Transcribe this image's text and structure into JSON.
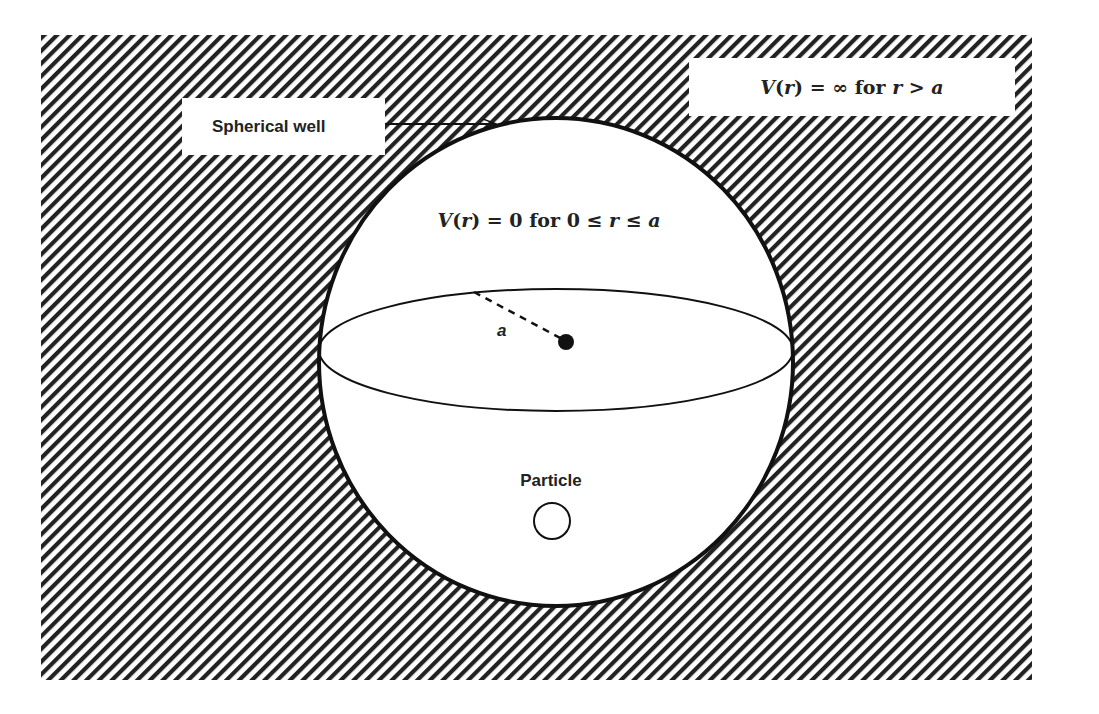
{
  "diagram": {
    "outer_label": {
      "text_parts": [
        "V",
        "(",
        "r",
        ") = ∞ for ",
        "r",
        " > ",
        "a"
      ],
      "plain": "V(r) = ∞ for r > a"
    },
    "inner_label": {
      "text_parts": [
        "V",
        "(",
        "r",
        ") = 0 for 0 ≤ ",
        "r",
        " ≤ ",
        "a"
      ],
      "plain": "V(r) = 0 for 0 ≤ r ≤ a"
    },
    "well_label": "Spherical well",
    "radius_label": "a",
    "particle_label": "Particle",
    "colors": {
      "hatch": "#222222",
      "background": "#ffffff",
      "outline": "#111111"
    },
    "icons": {
      "arrow": "arrow-right-icon",
      "center": "center-dot-icon",
      "particle": "particle-circle-icon"
    }
  }
}
